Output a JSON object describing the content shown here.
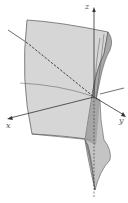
{
  "figure": {
    "type": "3d-surface-plot",
    "axes": {
      "x": {
        "label": "x"
      },
      "y": {
        "label": "y"
      },
      "z": {
        "label": "z"
      }
    },
    "colors": {
      "surface_light": "#d9d9d9",
      "surface_mid": "#bdbdbd",
      "surface_dark": "#8f8f8f",
      "edge": "#555555",
      "axis": "#444444"
    }
  }
}
